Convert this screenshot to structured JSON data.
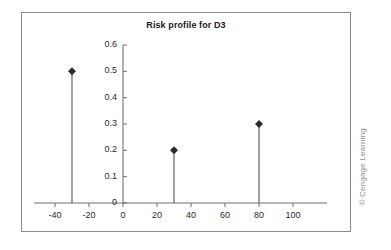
{
  "figure": {
    "width": 391,
    "height": 250,
    "background": "#ffffff",
    "frame_color": "#8a8a8a",
    "credit": "© Cengage Learning"
  },
  "chart_data": {
    "type": "scatter",
    "title": "Risk profile for D3",
    "xlabel": "",
    "ylabel": "",
    "x": [
      -30,
      30,
      80
    ],
    "values": [
      0.5,
      0.2,
      0.3
    ],
    "points": [
      {
        "x": -30,
        "y": 0.5
      },
      {
        "x": 30,
        "y": 0.2
      },
      {
        "x": 80,
        "y": 0.3
      }
    ],
    "xlim": [
      -40,
      100
    ],
    "ylim": [
      0,
      0.6
    ],
    "xticks": [
      -40,
      -20,
      0,
      20,
      40,
      60,
      80,
      100
    ],
    "xticklabels": [
      "-40",
      "-20",
      "0",
      "20",
      "40",
      "60",
      "80",
      "100"
    ],
    "yticks": [
      0,
      0.1,
      0.2,
      0.3,
      0.4,
      0.5,
      0.6
    ],
    "yticklabels": [
      "0",
      "0.1",
      "0.2",
      "0.3",
      "0.4",
      "0.5",
      "0.6"
    ],
    "grid": false,
    "legend": false,
    "marker": "filled-diamond",
    "marker_color": "#2b2b2b",
    "stem_color": "#555555",
    "axis_color": "#6f6f6f",
    "style": "stem-plot"
  }
}
